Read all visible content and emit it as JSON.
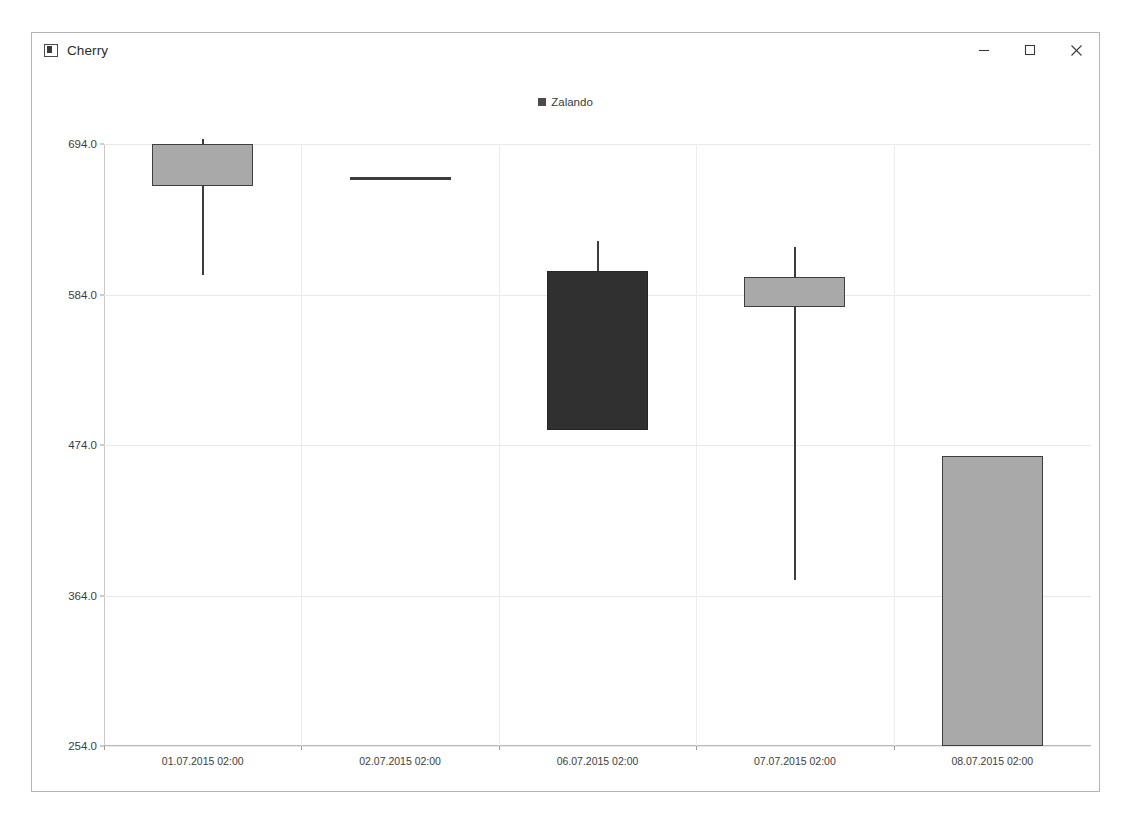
{
  "window": {
    "title": "Cherry",
    "icon": "application-icon",
    "controls": [
      {
        "name": "minimize-button",
        "glyph": "minimize"
      },
      {
        "name": "maximize-button",
        "glyph": "maximize"
      },
      {
        "name": "close-button",
        "glyph": "close"
      }
    ]
  },
  "chart_data": {
    "type": "bar",
    "subtype": "candlestick",
    "title": "",
    "legend": {
      "position": "top-center",
      "entries": [
        "Zalando"
      ]
    },
    "series_name": "Zalando",
    "xlabel": "",
    "ylabel": "",
    "grid": true,
    "ylim": [
      254.0,
      694.0
    ],
    "ytick_labels": [
      "694.0",
      "584.0",
      "474.0",
      "364.0",
      "254.0"
    ],
    "yticks": [
      694.0,
      584.0,
      474.0,
      364.0,
      254.0
    ],
    "categories": [
      "01.07.2015 02:00",
      "02.07.2015 02:00",
      "06.07.2015 02:00",
      "07.07.2015 02:00",
      "08.07.2015 02:00"
    ],
    "candles": [
      {
        "x": "01.07.2015 02:00",
        "open": 663.0,
        "high": 698.0,
        "low": 598.0,
        "close": 694.0,
        "direction": "up"
      },
      {
        "x": "02.07.2015 02:00",
        "open": 669.0,
        "high": 669.0,
        "low": 669.0,
        "close": 669.0,
        "direction": "doji"
      },
      {
        "x": "06.07.2015 02:00",
        "open": 601.0,
        "high": 623.0,
        "low": 485.0,
        "close": 485.0,
        "direction": "down"
      },
      {
        "x": "07.07.2015 02:00",
        "open": 575.0,
        "high": 619.0,
        "low": 375.0,
        "close": 597.0,
        "direction": "up"
      },
      {
        "x": "08.07.2015 02:00",
        "open": 254.0,
        "high": 466.0,
        "low": 254.0,
        "close": 466.0,
        "direction": "up"
      }
    ],
    "colors": {
      "up_fill": "#a9a9a9",
      "down_fill": "#303030",
      "outline": "#3f3f3f",
      "grid": "#e9e9e9",
      "axis": "#b9b9b9",
      "text": "#3d3d3d",
      "legend_swatch": "#4b4b4b"
    }
  }
}
